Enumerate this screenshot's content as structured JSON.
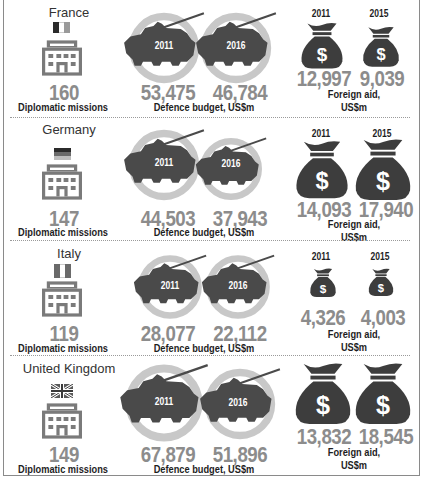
{
  "labels": {
    "diplomatic": "Diplomatic missions",
    "defence": "Defence budget, US$m",
    "aid_line1": "Foreign aid,",
    "aid_line2": "US$m"
  },
  "countries": [
    {
      "name": "France",
      "flag": "france-flag",
      "diplomatic_missions": "160",
      "defence": {
        "year1": "2011",
        "value1": "53,475",
        "year2": "2016",
        "value2": "46,784"
      },
      "aid": {
        "year1": "2011",
        "value1": "12,997",
        "year2": "2015",
        "value2": "9,039"
      }
    },
    {
      "name": "Germany",
      "flag": "germany-flag",
      "diplomatic_missions": "147",
      "defence": {
        "year1": "2011",
        "value1": "44,503",
        "year2": "2016",
        "value2": "37,943"
      },
      "aid": {
        "year1": "2011",
        "value1": "14,093",
        "year2": "2015",
        "value2": "17,940"
      }
    },
    {
      "name": "Italy",
      "flag": "italy-flag",
      "diplomatic_missions": "119",
      "defence": {
        "year1": "2011",
        "value1": "28,077",
        "year2": "2016",
        "value2": "22,112"
      },
      "aid": {
        "year1": "2011",
        "value1": "4,326",
        "year2": "2015",
        "value2": "4,003"
      }
    },
    {
      "name": "United Kingdom",
      "flag": "uk-flag",
      "diplomatic_missions": "149",
      "defence": {
        "year1": "2011",
        "value1": "67,879",
        "year2": "2016",
        "value2": "51,896"
      },
      "aid": {
        "year1": "2011",
        "value1": "13,832",
        "year2": "2015",
        "value2": "18,545"
      }
    }
  ],
  "colors": {
    "icon_dark": "#3d3d3d",
    "number_gray": "#8c8c8c",
    "ring_gray": "#c8c8c8",
    "building_gray": "#7a7a7a"
  }
}
